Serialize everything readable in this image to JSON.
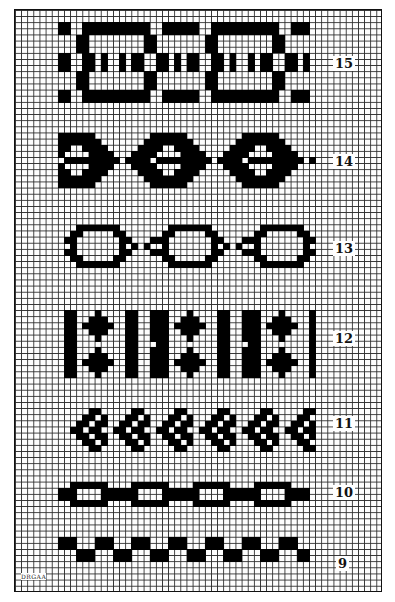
{
  "grid": {
    "cols": 60,
    "rows": 95,
    "cell": 6.13,
    "ink": "#000000",
    "paper": "#ffffff",
    "line": "#2a2a2a"
  },
  "labels": [
    {
      "text": "15",
      "x": 333,
      "y": 56
    },
    {
      "text": "14",
      "x": 333,
      "y": 154
    },
    {
      "text": "13",
      "x": 333,
      "y": 241
    },
    {
      "text": "12",
      "x": 333,
      "y": 331
    },
    {
      "text": "11",
      "x": 333,
      "y": 416
    },
    {
      "text": "10",
      "x": 333,
      "y": 485
    },
    {
      "text": "9",
      "x": 336,
      "y": 556
    }
  ],
  "signature": "DRGAA",
  "patterns": [
    {
      "id": "15",
      "row0": 2,
      "col0": 7,
      "repeat": 21,
      "count": 4,
      "maxcol": 47,
      "rows": [
        "XX..XXXXXXXXXXX..XXXX",
        "XX..XXXXXXXXXXX..XXXX",
        "...XX.........XX.....",
        "...XX.........XX.....",
        "...XX.........XX.....",
        "XX..XX.X..X.XX..XX.X.",
        "XX..XX.X..X.XX..XX.X.",
        "XX..XX.X..X.XX..XX.X.",
        "...XX.........XX.....",
        "...XX.........XX.....",
        "...XX.........XX.....",
        "XX..XXXXXXXXXXX..XXXX",
        "XX..XXXXXXXXXXX..XXXX"
      ]
    },
    {
      "id": "14",
      "row0": 20,
      "col0": 7,
      "repeat": 15,
      "count": 3,
      "maxcol": 48,
      "rows": [
        "XXXXXX.........",
        "XXXXXXX.......X",
        "XX..XXXX.....XX",
        "X....XXXX...XXX",
        ".XXXXXXXXX.XXXX",
        "X....XXXX...XXX",
        "XX..XXXX.....XX",
        "XXXXXXX.......X",
        "XXXXXX........."
      ]
    },
    {
      "id": "13",
      "row0": 35,
      "col0": 8,
      "repeat": 15,
      "count": 3,
      "maxcol": 48,
      "rows": [
        "..XXXXXXX......",
        ".XX.....XX.....",
        "XX.......XX...X",
        ".X.......X.X.X.",
        "XX.......XX...X",
        ".XX.....XX.....",
        "..XXXXXXX......"
      ]
    },
    {
      "id": "12",
      "row0": 49,
      "col0": 8,
      "repeat": 15,
      "count": 3,
      "maxcol": 48,
      "rows": [
        "XX...X....XX..X",
        "XX..XXX...XX..X",
        "XX.XXXXX..XX..X",
        "XX..XXX...XX..X",
        "XX...X....XX..X",
        "XX........XX...",
        "XX...X....XX..X",
        "XX..XXX...XX..X",
        "XX.XXXXX..XX..X",
        "XX..XXX...XX..X",
        "XX...X....XX..X"
      ]
    },
    {
      "id": "11",
      "row0": 65,
      "col0": 9,
      "repeat": 7,
      "count": 6,
      "maxcol": 48,
      "rows": [
        "...XX..",
        "..XX.X.",
        ".XX.XX.",
        "XX.XX..",
        ".XX.XX.",
        "..XX.X.",
        "...XX.."
      ]
    },
    {
      "id": "10",
      "row0": 77,
      "col0": 7,
      "repeat": 10,
      "count": 4,
      "maxcol": 47,
      "rows": [
        "..XXXXXX..",
        "XXX....XXX",
        "XXX....XXX",
        "..XXXXXX.."
      ]
    },
    {
      "id": "9",
      "row0": 86,
      "col0": 7,
      "repeat": 6,
      "count": 7,
      "maxcol": 47,
      "rows": [
        "XXX...",
        "XXX...",
        "...XXX",
        "...XXX"
      ]
    }
  ]
}
